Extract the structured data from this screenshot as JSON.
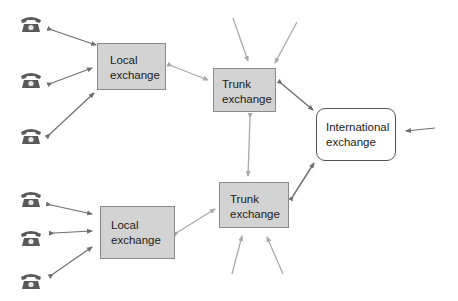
{
  "colors": {
    "box_fill": "#d3d3d3",
    "box_border": "#8a8a8a",
    "local_link": "#6e6e6e",
    "trunk_link": "#a9a9a9",
    "phone": "#5a5a5a"
  },
  "nodes": {
    "local_top": {
      "line1": "Local",
      "line2": "exchange"
    },
    "trunk_top": {
      "line1": "Trunk",
      "line2": "exchange"
    },
    "international": {
      "line1": "International",
      "line2": "exchange"
    },
    "trunk_bottom": {
      "line1": "Trunk",
      "line2": "exchange"
    },
    "local_bottom": {
      "line1": "Local",
      "line2": "exchange"
    }
  },
  "phones": {
    "icon": "telephone-icon",
    "count": 6
  }
}
